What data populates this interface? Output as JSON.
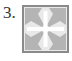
{
  "item": {
    "number_label": "3.",
    "icon": "shrink-arrows-icon"
  },
  "colors": {
    "border": "#8a8a8a",
    "arrow": "#b4b4b4",
    "background": "#e6e6e6",
    "cross": "#ffffff",
    "text": "#333333"
  }
}
